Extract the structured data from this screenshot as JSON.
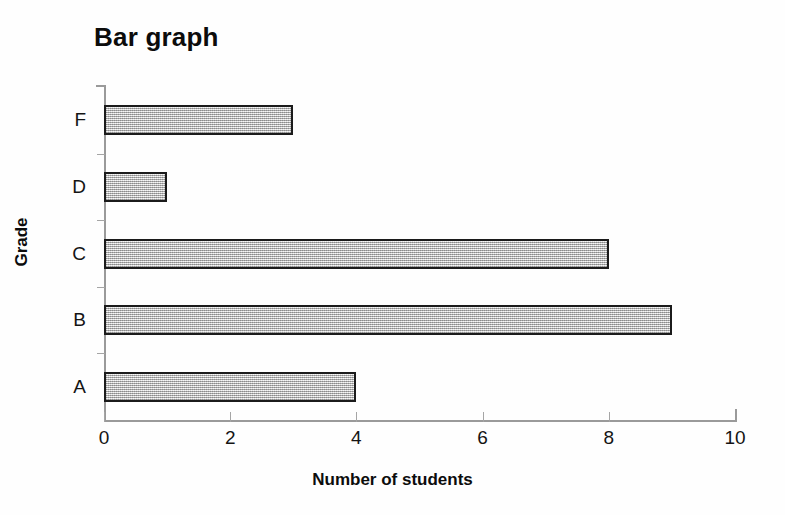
{
  "chart_data": {
    "type": "bar",
    "orientation": "horizontal",
    "title": "Bar graph",
    "xlabel": "Number of students",
    "ylabel": "Grade",
    "categories": [
      "A",
      "B",
      "C",
      "D",
      "F"
    ],
    "values": [
      4,
      9,
      8,
      1,
      3
    ],
    "display_order_top_to_bottom": [
      "F",
      "D",
      "C",
      "B",
      "A"
    ],
    "xlim": [
      0,
      10
    ],
    "xticks": [
      0,
      2,
      4,
      6,
      8,
      10
    ],
    "xtick_labels": [
      "0",
      "2",
      "4",
      "6",
      "8",
      "10"
    ],
    "grid": false,
    "legend": false,
    "bar_fill_color": "#c9c9c9",
    "bar_border_color": "#1b1b1b",
    "axis_color": "#9a9a9a",
    "background_color": "#fefefe",
    "bars": [
      {
        "category": "F",
        "value": 3,
        "label": "F"
      },
      {
        "category": "D",
        "value": 1,
        "label": "D"
      },
      {
        "category": "C",
        "value": 8,
        "label": "C"
      },
      {
        "category": "B",
        "value": 9,
        "label": "B"
      },
      {
        "category": "A",
        "value": 4,
        "label": "A"
      }
    ]
  }
}
